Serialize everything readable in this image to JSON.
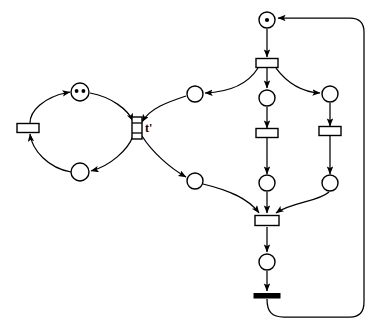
{
  "diagram": {
    "type": "petri-net",
    "title": "",
    "background_color": "#ffffff",
    "stroke_color": "#000000",
    "labels": [
      {
        "id": "t-prime-label",
        "text": "t'",
        "x": 145,
        "y": 122
      }
    ],
    "places": [
      {
        "id": "p-left-top",
        "name": "place-left-top",
        "cx": 80,
        "cy": 92,
        "r": 9,
        "tokens": 2
      },
      {
        "id": "p-left-bottom",
        "name": "place-left-bottom",
        "cx": 80,
        "cy": 172,
        "r": 9,
        "tokens": 0
      },
      {
        "id": "p-mid-upper",
        "name": "place-mid-upper",
        "cx": 195,
        "cy": 94,
        "r": 8,
        "tokens": 0
      },
      {
        "id": "p-mid-lower",
        "name": "place-mid-lower",
        "cx": 195,
        "cy": 181,
        "r": 8,
        "tokens": 0
      },
      {
        "id": "p-top",
        "name": "place-top-marked",
        "cx": 267,
        "cy": 20,
        "r": 8,
        "tokens": 1
      },
      {
        "id": "p-centre-up",
        "name": "place-centre-upper",
        "cx": 267,
        "cy": 98,
        "r": 8,
        "tokens": 0
      },
      {
        "id": "p-right-up",
        "name": "place-right-upper",
        "cx": 330,
        "cy": 94,
        "r": 8,
        "tokens": 0
      },
      {
        "id": "p-centre-low",
        "name": "place-centre-lower",
        "cx": 267,
        "cy": 183,
        "r": 8,
        "tokens": 0
      },
      {
        "id": "p-right-low",
        "name": "place-right-lower",
        "cx": 330,
        "cy": 183,
        "r": 8,
        "tokens": 0
      },
      {
        "id": "p-bottom",
        "name": "place-bottom",
        "cx": 267,
        "cy": 262,
        "r": 8,
        "tokens": 0
      }
    ],
    "transitions": [
      {
        "id": "t-left",
        "name": "transition-left",
        "cx": 29,
        "cy": 128,
        "w": 20,
        "h": 9,
        "orient": "h",
        "style": "hollow"
      },
      {
        "id": "t-prime",
        "name": "transition-t-prime",
        "cx": 137,
        "cy": 128,
        "w": 9,
        "h": 22,
        "orient": "v",
        "style": "hollow"
      },
      {
        "id": "t-fork",
        "name": "transition-fork",
        "cx": 267,
        "cy": 63,
        "w": 22,
        "h": 9,
        "orient": "h",
        "style": "hollow"
      },
      {
        "id": "t-centre",
        "name": "transition-centre-mid",
        "cx": 267,
        "cy": 133,
        "w": 22,
        "h": 9,
        "orient": "h",
        "style": "hollow"
      },
      {
        "id": "t-right",
        "name": "transition-right-mid",
        "cx": 330,
        "cy": 131,
        "w": 22,
        "h": 9,
        "orient": "h",
        "style": "hollow"
      },
      {
        "id": "t-join",
        "name": "transition-join",
        "cx": 267,
        "cy": 221,
        "w": 24,
        "h": 10,
        "orient": "h",
        "style": "hollow"
      },
      {
        "id": "t-sink",
        "name": "transition-sink-bar",
        "cx": 267,
        "cy": 296,
        "w": 26,
        "h": 4,
        "orient": "h",
        "style": "filled"
      }
    ],
    "arcs": [
      {
        "id": "a1",
        "name": "arc-tleft-to-pleft-top",
        "from": "t-left",
        "to": "p-left-top"
      },
      {
        "id": "a2",
        "name": "arc-pleft-top-to-tprime",
        "from": "p-left-top",
        "to": "t-prime"
      },
      {
        "id": "a3",
        "name": "arc-tprime-to-pleft-bot",
        "from": "t-prime",
        "to": "p-left-bottom"
      },
      {
        "id": "a4",
        "name": "arc-pleft-bot-to-tleft",
        "from": "p-left-bottom",
        "to": "t-left"
      },
      {
        "id": "a5",
        "name": "arc-pmid-upper-to-tprime",
        "from": "p-mid-upper",
        "to": "t-prime"
      },
      {
        "id": "a6",
        "name": "arc-tprime-to-pmid-lower",
        "from": "t-prime",
        "to": "p-mid-lower"
      },
      {
        "id": "a7",
        "name": "arc-ptop-to-tfork",
        "from": "p-top",
        "to": "t-fork"
      },
      {
        "id": "a8",
        "name": "arc-tfork-to-pmid-upper",
        "from": "t-fork",
        "to": "p-mid-upper"
      },
      {
        "id": "a9",
        "name": "arc-tfork-to-pcentre-up",
        "from": "t-fork",
        "to": "p-centre-up"
      },
      {
        "id": "a10",
        "name": "arc-tfork-to-pright-up",
        "from": "t-fork",
        "to": "p-right-up"
      },
      {
        "id": "a11",
        "name": "arc-pcentre-up-to-tcentre",
        "from": "p-centre-up",
        "to": "t-centre"
      },
      {
        "id": "a12",
        "name": "arc-pright-up-to-tright",
        "from": "p-right-up",
        "to": "t-right"
      },
      {
        "id": "a13",
        "name": "arc-tcentre-to-pcentre-low",
        "from": "t-centre",
        "to": "p-centre-low"
      },
      {
        "id": "a14",
        "name": "arc-tright-to-pright-low",
        "from": "t-right",
        "to": "p-right-low"
      },
      {
        "id": "a15",
        "name": "arc-pmid-lower-to-tjoin",
        "from": "p-mid-lower",
        "to": "t-join"
      },
      {
        "id": "a16",
        "name": "arc-pcentre-low-to-tjoin",
        "from": "p-centre-low",
        "to": "t-join"
      },
      {
        "id": "a17",
        "name": "arc-pright-low-to-tjoin",
        "from": "p-right-low",
        "to": "t-join"
      },
      {
        "id": "a18",
        "name": "arc-tjoin-to-pbottom",
        "from": "t-join",
        "to": "p-bottom"
      },
      {
        "id": "a19",
        "name": "arc-pbottom-to-tsink",
        "from": "p-bottom",
        "to": "t-sink"
      },
      {
        "id": "a20",
        "name": "arc-tsink-feedback-to-ptop",
        "from": "t-sink",
        "to": "p-top"
      }
    ]
  }
}
